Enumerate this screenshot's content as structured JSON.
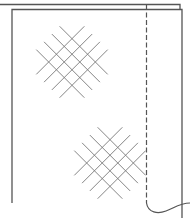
{
  "diagram": {
    "colors": {
      "panel_outline": "#555555",
      "hatch": "#777777",
      "seam": "#555555",
      "background": "#ffffff"
    },
    "back_panel": {
      "top_y": 4,
      "left_x": 0,
      "right_x": 180,
      "right_bottom_y": 9
    },
    "front_panel": {
      "top_y": 9,
      "left_x": 12,
      "right_x": 182,
      "left_bottom_y": 203,
      "right_bottom_y": 217
    },
    "seam_line": {
      "x": 146,
      "top_y": 5,
      "bottom_y": 203,
      "style": "dashed"
    },
    "hatch_patches": [
      {
        "name": "upper",
        "cx": 72,
        "cy": 62,
        "lines_per_direction": 4,
        "spacing": 11,
        "half_length": 34
      },
      {
        "name": "lower",
        "cx": 110,
        "cy": 163,
        "lines_per_direction": 4,
        "spacing": 11,
        "half_length": 34
      }
    ]
  }
}
